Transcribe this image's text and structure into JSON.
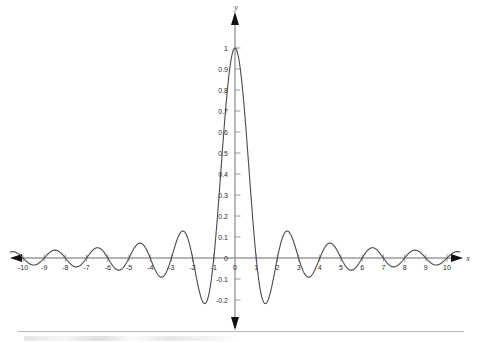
{
  "chart_data": {
    "type": "line",
    "title": "",
    "subtitle": "",
    "xlabel": "x",
    "ylabel": "y",
    "function": "sin(pi*x)/(pi*x)",
    "function_name": "sinc",
    "xlim": [
      -10.6,
      10.6
    ],
    "ylim": [
      -0.28,
      1.06
    ],
    "grid": false,
    "legend": null,
    "legend_position": "none",
    "axis_style": "arrow-tipped cartesian axes through origin",
    "x_ticks": [
      -10,
      -9,
      -8,
      -7,
      -6,
      -5,
      -4,
      -3,
      -2,
      -1,
      0,
      1,
      2,
      3,
      4,
      5,
      6,
      7,
      8,
      9,
      10
    ],
    "x_tick_labels": [
      "-10",
      "-9",
      "-8",
      "-7",
      "-6",
      "-5",
      "-4",
      "-3",
      "-2",
      "-1",
      "0",
      "1",
      "2",
      "3",
      "4",
      "5",
      "6",
      "7",
      "8",
      "9",
      "10"
    ],
    "y_ticks": [
      -0.2,
      -0.1,
      0,
      0.1,
      0.2,
      0.3,
      0.4,
      0.5,
      0.6,
      0.7,
      0.8,
      0.9,
      1
    ],
    "y_tick_labels": [
      "-0.2",
      "-0.1",
      "0",
      "0.1",
      "0.2",
      "0.3",
      "0.4",
      "0.5",
      "0.6",
      "0.7",
      "0.8",
      "0.9",
      "1"
    ],
    "series": [
      {
        "name": "sinc(x)",
        "color": "#4a4a4a",
        "line_width": 1.1,
        "zeros": [
          -10,
          -9,
          -8,
          -7,
          -6,
          -5,
          -4,
          -3,
          -2,
          -1,
          1,
          2,
          3,
          4,
          5,
          6,
          7,
          8,
          9,
          10
        ],
        "extrema": [
          {
            "x": 0,
            "y": 1
          },
          {
            "x": 1.4303,
            "y": -0.2172
          },
          {
            "x": -1.4303,
            "y": -0.2172
          },
          {
            "x": 2.459,
            "y": 0.1284
          },
          {
            "x": -2.459,
            "y": 0.1284
          },
          {
            "x": 3.4709,
            "y": -0.0913
          },
          {
            "x": -3.4709,
            "y": -0.0913
          },
          {
            "x": 4.4775,
            "y": 0.0709
          },
          {
            "x": -4.4775,
            "y": 0.0709
          },
          {
            "x": 5.4816,
            "y": -0.058
          },
          {
            "x": -5.4816,
            "y": -0.058
          },
          {
            "x": 6.4844,
            "y": 0.049
          },
          {
            "x": -6.4844,
            "y": 0.049
          },
          {
            "x": 7.4864,
            "y": -0.0425
          },
          {
            "x": -7.4864,
            "y": -0.0425
          },
          {
            "x": 8.4879,
            "y": 0.0375
          },
          {
            "x": -8.4879,
            "y": 0.0375
          },
          {
            "x": 9.4891,
            "y": -0.0335
          },
          {
            "x": -9.4891,
            "y": -0.0335
          }
        ]
      }
    ]
  },
  "axes": {
    "x_axis_name": "x",
    "y_axis_name": "y",
    "origin_label": "0"
  },
  "colors": {
    "curve": "#4a4a4a",
    "axis_line": "#9a9a9a",
    "arrow": "#111111",
    "tick_text": "#2b2b2b",
    "axis_label": "#3a3a3a",
    "background": "#ffffff",
    "footer_rule": "#b8b8b8"
  },
  "geometry": {
    "origin_x_px": 235,
    "origin_y_px": 258,
    "x_unit_px": 21.2,
    "y_unit_px": 210
  }
}
